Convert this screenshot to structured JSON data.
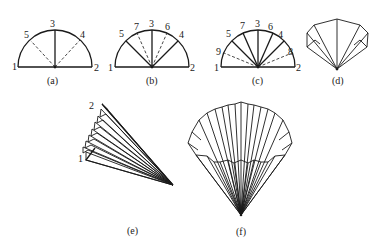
{
  "figure": {
    "panels": [
      {
        "id": "a",
        "caption": "(a)",
        "point_labels": [
          "1",
          "2",
          "3",
          "4",
          "5"
        ]
      },
      {
        "id": "b",
        "caption": "(b)",
        "point_labels": [
          "1",
          "2",
          "3",
          "4",
          "5",
          "6",
          "7"
        ]
      },
      {
        "id": "c",
        "caption": "(c)",
        "point_labels": [
          "1",
          "2",
          "3",
          "4",
          "5",
          "6",
          "7",
          "8",
          "9"
        ]
      },
      {
        "id": "d",
        "caption": "(d)"
      },
      {
        "id": "e",
        "caption": "(e)",
        "point_labels": [
          "1",
          "2"
        ]
      },
      {
        "id": "f",
        "caption": "(f)"
      }
    ]
  },
  "colors": {
    "line": "#1a1a1a",
    "background": "#ffffff"
  }
}
